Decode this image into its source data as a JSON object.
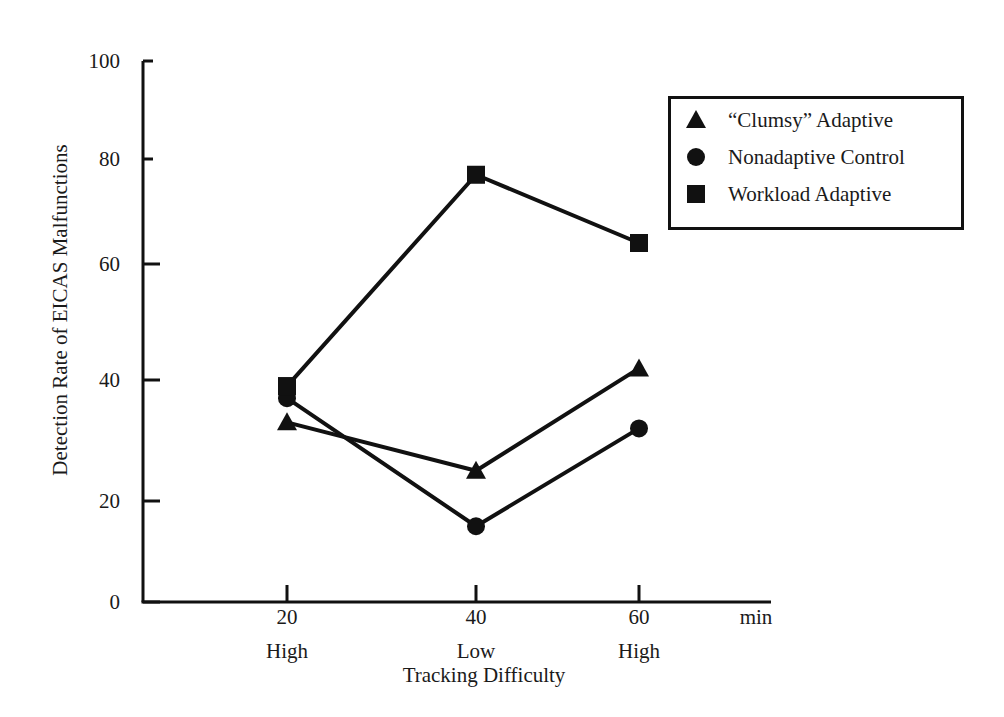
{
  "chart_data": {
    "type": "line",
    "title": "",
    "xlabel": "Tracking Difficulty",
    "ylabel": "Detection Rate of EICAS Malfunctions",
    "x_unit": "min",
    "x": [
      20,
      40,
      60
    ],
    "x_tick_labels": [
      "20",
      "40",
      "60"
    ],
    "x_sub_labels": [
      "High",
      "Low",
      "High"
    ],
    "y_ticks": [
      0,
      20,
      40,
      60,
      80,
      100
    ],
    "ylim": [
      0,
      100
    ],
    "grid": false,
    "legend_position": "upper right",
    "series": [
      {
        "name": "“Clumsy” Adaptive",
        "marker": "triangle",
        "values": [
          33,
          25,
          42
        ]
      },
      {
        "name": "Nonadaptive Control",
        "marker": "circle",
        "values": [
          37,
          15,
          32
        ]
      },
      {
        "name": "Workload Adaptive",
        "marker": "square",
        "values": [
          39,
          77,
          64
        ]
      }
    ]
  },
  "colors": {
    "ink": "#111111",
    "background": "#ffffff"
  }
}
